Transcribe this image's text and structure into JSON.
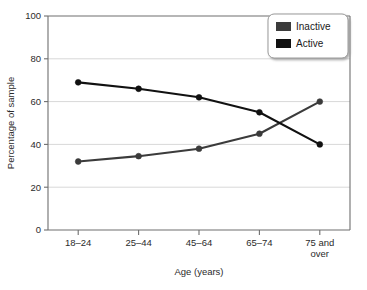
{
  "chart_data": {
    "type": "line",
    "title": "",
    "xlabel": "Age (years)",
    "ylabel": "Percentage of sample",
    "categories": [
      "18–24",
      "25–44",
      "45–64",
      "65–74",
      "75 and over"
    ],
    "category_lines": [
      [
        "18–24"
      ],
      [
        "25–44"
      ],
      [
        "45–64"
      ],
      [
        "65–74"
      ],
      [
        "75 and",
        "over"
      ]
    ],
    "ylim": [
      0,
      100
    ],
    "yticks": [
      0,
      20,
      40,
      60,
      80,
      100
    ],
    "ytick_labels": [
      "0",
      "20",
      "40",
      "60",
      "80",
      "100"
    ],
    "grid": "horizontal",
    "legend_position": "top-right",
    "series": [
      {
        "name": "Inactive",
        "color": "#3b3b3b",
        "values": [
          32,
          34.5,
          38,
          45,
          60
        ]
      },
      {
        "name": "Active",
        "color": "#111111",
        "values": [
          69,
          66,
          62,
          55,
          40
        ]
      }
    ]
  },
  "legend": {
    "items": [
      {
        "label": "Inactive",
        "swatch_color": "#3b3b3b"
      },
      {
        "label": "Active",
        "swatch_color": "#111111"
      }
    ]
  },
  "colors": {
    "axis": "#6e6e6e",
    "grid": "#d8d8d8",
    "background": "#ffffff",
    "text": "#2b2b2b",
    "legend_border": "#9a9a9a",
    "legend_background": "#ffffff"
  }
}
